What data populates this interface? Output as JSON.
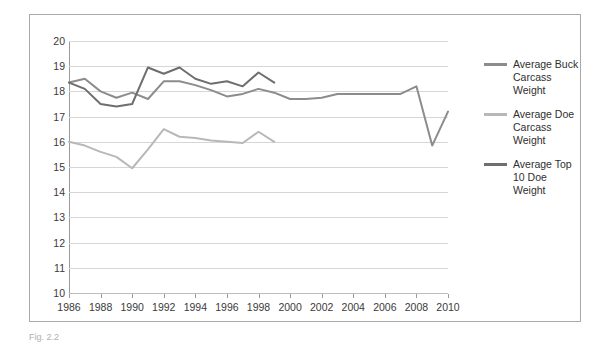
{
  "chart_data": {
    "type": "line",
    "title": "",
    "xlabel": "",
    "ylabel": "",
    "xlim": [
      1986,
      2010
    ],
    "ylim": [
      10,
      20
    ],
    "grid": true,
    "legend_position": "right",
    "x_ticks": [
      1986,
      1988,
      1990,
      1992,
      1994,
      1996,
      1998,
      2000,
      2002,
      2004,
      2006,
      2008,
      2010
    ],
    "y_ticks": [
      10,
      11,
      12,
      13,
      14,
      15,
      16,
      17,
      18,
      19,
      20
    ],
    "series": [
      {
        "name": "Average Buck Carcass Weight",
        "color": "#8c8c8c",
        "x": [
          1986,
          1987,
          1988,
          1989,
          1990,
          1991,
          1992,
          1993,
          1994,
          1995,
          1996,
          1997,
          1998,
          1999,
          2000,
          2001,
          2002,
          2003,
          2004,
          2005,
          2006,
          2007,
          2008,
          2009,
          2010
        ],
        "values": [
          18.35,
          18.5,
          18.0,
          17.75,
          17.95,
          17.7,
          18.4,
          18.4,
          18.25,
          18.05,
          17.8,
          17.9,
          18.1,
          17.95,
          17.7,
          17.7,
          17.75,
          17.9,
          17.9,
          17.9,
          17.9,
          17.9,
          18.2,
          15.85,
          17.2
        ]
      },
      {
        "name": "Average Doe Carcass Weight",
        "color": "#b8b8b8",
        "x": [
          1986,
          1987,
          1988,
          1989,
          1990,
          1991,
          1992,
          1993,
          1994,
          1995,
          1996,
          1997,
          1998,
          1999
        ],
        "values": [
          16.0,
          15.85,
          15.6,
          15.4,
          14.95,
          15.7,
          16.5,
          16.2,
          16.15,
          16.05,
          16.0,
          15.95,
          16.4,
          16.0
        ]
      },
      {
        "name": "Average Top 10 Doe Weight",
        "color": "#6e6e6e",
        "x": [
          1986,
          1987,
          1988,
          1989,
          1990,
          1991,
          1992,
          1993,
          1994,
          1995,
          1996,
          1997,
          1998,
          1999
        ],
        "values": [
          18.35,
          18.1,
          17.5,
          17.4,
          17.5,
          18.95,
          18.7,
          18.95,
          18.5,
          18.3,
          18.4,
          18.2,
          18.75,
          18.35
        ]
      }
    ]
  },
  "legend": {
    "items": [
      {
        "label": "Average Buck Carcass Weight"
      },
      {
        "label": "Average Doe Carcass Weight"
      },
      {
        "label": "Average Top 10 Doe Weight"
      }
    ]
  },
  "caption": {
    "text": "Fig. 2.2"
  }
}
